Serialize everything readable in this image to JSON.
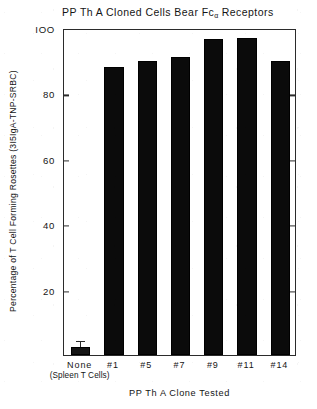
{
  "chart_data": {
    "type": "bar",
    "title": "PP Th A Cloned Cells Bear Fcα Receptors",
    "title_main": "PP Th A Cloned Cells Bear Fc",
    "title_subscript": "α",
    "title_tail": " Receptors",
    "xlabel": "PP Th A Clone Tested",
    "ylabel": "Percentage of T Cell Forming Rosettes (3I5IgA-TNP-SRBC)",
    "ylabel_main": "Percentage of T Cell Forming Rosettes (3I5IgA-TNP-SRBC)",
    "categories": [
      "None\n(Spleen T Cells)",
      "#1",
      "#5",
      "#7",
      "#9",
      "#11",
      "#14"
    ],
    "category_labels": [
      {
        "line1": "None",
        "line2": "(Spleen T Cells)"
      },
      {
        "line1": "#1",
        "line2": ""
      },
      {
        "line1": "#5",
        "line2": ""
      },
      {
        "line1": "#7",
        "line2": ""
      },
      {
        "line1": "#9",
        "line2": ""
      },
      {
        "line1": "#11",
        "line2": ""
      },
      {
        "line1": "#14",
        "line2": ""
      }
    ],
    "values": [
      2.5,
      88,
      90,
      91,
      96.5,
      97,
      90
    ],
    "errors": [
      1.5,
      0,
      0,
      0,
      0,
      0,
      0
    ],
    "ylim": [
      0,
      100
    ],
    "yticks": [
      20,
      40,
      60,
      80,
      100
    ],
    "ytick_labels": [
      "20",
      "40",
      "60",
      "80",
      "IOO"
    ],
    "grid": false,
    "legend": "none",
    "bar_color": "#0b0b0b",
    "axis_color": "#2b2b2b",
    "background": "#ffffff"
  }
}
